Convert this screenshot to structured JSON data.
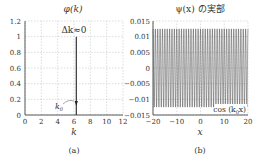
{
  "chart_data": [
    {
      "type": "line",
      "panel_label": "(a)",
      "title": "φ(k)",
      "xlabel": "k",
      "ylabel": "",
      "xlim": [
        0,
        12.5
      ],
      "ylim": [
        0,
        1.2
      ],
      "xticks": [
        "0",
        "2",
        "4",
        "6",
        "8",
        "10",
        "12"
      ],
      "yticks": [
        "0",
        "0.2",
        "0.4",
        "0.6",
        "0.8",
        "1",
        "1.2"
      ],
      "grid": true,
      "series": [
        {
          "name": "φ(k)",
          "x": [
            6.28,
            6.28
          ],
          "y": [
            0,
            1
          ]
        }
      ],
      "annotations": [
        "Δk≈0",
        "k₀"
      ]
    },
    {
      "type": "line",
      "panel_label": "(b)",
      "title": "ψ(x) の実部",
      "xlabel": "x",
      "ylabel": "",
      "xlim": [
        -20,
        20
      ],
      "ylim": [
        -0.015,
        0.015
      ],
      "xticks": [
        "−20",
        "−10",
        "0",
        "10",
        "20"
      ],
      "yticks": [
        "−0.015",
        "−0.01",
        "−0.005",
        "0",
        "0.005",
        "0.01",
        "0.015"
      ],
      "grid": true,
      "series": [
        {
          "name": "cos(k₀x)",
          "function": "0.0125*cos(6.28*x)",
          "amplitude": 0.0125,
          "k0": 6.28
        }
      ],
      "legend": {
        "label": "cos (k₀x)",
        "position": "lower right"
      }
    }
  ],
  "panel_a": {
    "title": "φ(k)",
    "annotation_delta": "Δk≈0",
    "annotation_k0": "k",
    "annotation_k0_sub": "0",
    "xlabel": "k",
    "caption": "(a)"
  },
  "panel_b": {
    "title": "ψ(x) の実部",
    "legend_text": "cos (k",
    "legend_sub": "0",
    "legend_tail": "x)",
    "xlabel": "x",
    "caption": "(b)"
  }
}
